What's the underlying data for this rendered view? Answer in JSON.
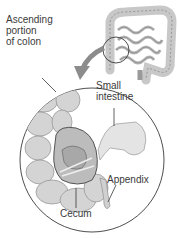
{
  "diagram": {
    "labels": {
      "ascending_colon": "Ascending\nportion\nof colon",
      "small_intestine": "Small\nintestine",
      "appendix": "Appendix",
      "cecum": "Cecum"
    },
    "colors": {
      "outline": "#3a3a3a",
      "tissue": "#d6d6d6",
      "tissue_dark": "#9a9a9a",
      "arrow": "#8c8c8c"
    }
  }
}
